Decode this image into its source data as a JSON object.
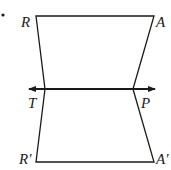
{
  "diagram": {
    "type": "geometry-reflection",
    "line_color": "#1a1a1a",
    "labels": {
      "R": "R",
      "A": "A",
      "T": "T",
      "P": "P",
      "R_prime": "R′",
      "A_prime": "A′"
    },
    "points": {
      "R": [
        36,
        16
      ],
      "A": [
        154,
        16
      ],
      "T": [
        45,
        89
      ],
      "P": [
        133,
        89
      ],
      "R_prime": [
        36,
        162
      ],
      "A_prime": [
        154,
        162
      ]
    },
    "reflection_line": {
      "y": 89,
      "x_start": 27,
      "x_end": 157,
      "arrows": "both"
    }
  }
}
